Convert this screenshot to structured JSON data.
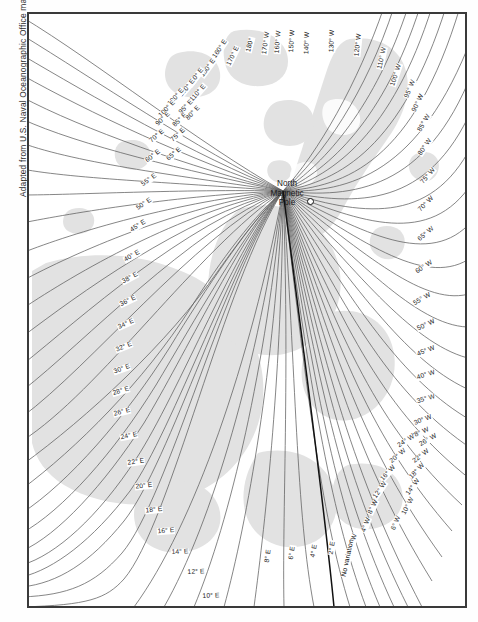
{
  "credit": "Adapted from U.S. Naval Oceanographic Office map",
  "pole": {
    "line1": "North",
    "line2": "Magnetic",
    "line3": "Pole",
    "marker": "pole-marker-circle"
  },
  "colors": {
    "background": "#ffffff",
    "frame": "#3a3a3a",
    "contour": "#5d5d5d",
    "agonic": "#111111",
    "land": "#e2e2e2",
    "text": "#1c1c1c"
  },
  "chart_data": {
    "type": "line",
    "xlabel": "",
    "ylabel": "",
    "legend": "none",
    "grid": false,
    "annotations": [
      "North Magnetic Pole",
      "No variation"
    ],
    "units": "degrees of magnetic variation (declination)",
    "east_values": [
      10,
      12,
      14,
      16,
      18,
      20,
      22,
      24,
      26,
      28,
      30,
      32,
      34,
      36,
      38,
      40,
      45,
      50,
      55,
      60,
      65,
      70,
      75,
      80,
      85,
      90,
      95,
      100,
      110,
      120,
      130,
      140,
      150,
      160,
      170,
      180
    ],
    "west_values": [
      2,
      4,
      6,
      8,
      10,
      12,
      14,
      16,
      18,
      20,
      22,
      24,
      26,
      28,
      30,
      35,
      40,
      45,
      50,
      55,
      60,
      65,
      70,
      75,
      80,
      85,
      90,
      95,
      100,
      110,
      120,
      130,
      140,
      150,
      160,
      170
    ],
    "agonic_label": "No variation",
    "small_east_values": [
      2,
      4,
      6,
      8
    ]
  },
  "labels": [
    {
      "t": "160° E",
      "x": 192,
      "y": 36,
      "r": -56
    },
    {
      "t": "150° E",
      "x": 180,
      "y": 55,
      "r": -54
    },
    {
      "t": "140° E",
      "x": 168,
      "y": 64,
      "r": -52
    },
    {
      "t": "130° E",
      "x": 159,
      "y": 75,
      "r": -50
    },
    {
      "t": "120° E",
      "x": 148,
      "y": 84,
      "r": -48
    },
    {
      "t": "110° E",
      "x": 170,
      "y": 80,
      "r": -49
    },
    {
      "t": "100° E",
      "x": 139,
      "y": 96,
      "r": -46
    },
    {
      "t": "95° E",
      "x": 158,
      "y": 94,
      "r": -46
    },
    {
      "t": "90° E",
      "x": 135,
      "y": 106,
      "r": -44
    },
    {
      "t": "85° E",
      "x": 152,
      "y": 107,
      "r": -44
    },
    {
      "t": "80° E",
      "x": 165,
      "y": 100,
      "r": -46
    },
    {
      "t": "75° E",
      "x": 150,
      "y": 122,
      "r": -42
    },
    {
      "t": "70° E",
      "x": 129,
      "y": 123,
      "r": -40
    },
    {
      "t": "65° E",
      "x": 146,
      "y": 141,
      "r": -40
    },
    {
      "t": "60° E",
      "x": 125,
      "y": 143,
      "r": -38
    },
    {
      "t": "55° E",
      "x": 121,
      "y": 167,
      "r": -36
    },
    {
      "t": "50° E",
      "x": 116,
      "y": 191,
      "r": -34
    },
    {
      "t": "45° E",
      "x": 110,
      "y": 213,
      "r": -32
    },
    {
      "t": "40° E",
      "x": 104,
      "y": 243,
      "r": -30
    },
    {
      "t": "38° E",
      "x": 102,
      "y": 265,
      "r": -28
    },
    {
      "t": "36° E",
      "x": 100,
      "y": 288,
      "r": -26
    },
    {
      "t": "34° E",
      "x": 98,
      "y": 311,
      "r": -24
    },
    {
      "t": "32° E",
      "x": 96,
      "y": 334,
      "r": -22
    },
    {
      "t": "30° E",
      "x": 94,
      "y": 356,
      "r": -20
    },
    {
      "t": "28° E",
      "x": 93,
      "y": 378,
      "r": -17
    },
    {
      "t": "26° E",
      "x": 94,
      "y": 399,
      "r": -14
    },
    {
      "t": "24° E",
      "x": 101,
      "y": 423,
      "r": -11
    },
    {
      "t": "22° E",
      "x": 108,
      "y": 449,
      "r": -8
    },
    {
      "t": "20° E",
      "x": 116,
      "y": 473,
      "r": -6
    },
    {
      "t": "18° E",
      "x": 126,
      "y": 497,
      "r": -5
    },
    {
      "t": "16° E",
      "x": 138,
      "y": 518,
      "r": -4
    },
    {
      "t": "14° E",
      "x": 152,
      "y": 539,
      "r": -3
    },
    {
      "t": "12° E",
      "x": 168,
      "y": 559,
      "r": -2
    },
    {
      "t": "10° E",
      "x": 183,
      "y": 583,
      "r": -2
    },
    {
      "t": "180°",
      "x": 222,
      "y": 32,
      "r": -76
    },
    {
      "t": "170° E",
      "x": 205,
      "y": 43,
      "r": -64
    },
    {
      "t": "170° W",
      "x": 238,
      "y": 30,
      "r": -82
    },
    {
      "t": "160° W",
      "x": 250,
      "y": 29,
      "r": -85
    },
    {
      "t": "150° W",
      "x": 264,
      "y": 28,
      "r": -87
    },
    {
      "t": "140° W",
      "x": 279,
      "y": 30,
      "r": -88
    },
    {
      "t": "130° W",
      "x": 304,
      "y": 28,
      "r": -88
    },
    {
      "t": "120° W",
      "x": 330,
      "y": 32,
      "r": -84
    },
    {
      "t": "110° W",
      "x": 354,
      "y": 45,
      "r": -78
    },
    {
      "t": "100° W",
      "x": 368,
      "y": 62,
      "r": -72
    },
    {
      "t": "95° W",
      "x": 382,
      "y": 76,
      "r": -68
    },
    {
      "t": "90° W",
      "x": 390,
      "y": 90,
      "r": -64
    },
    {
      "t": "85° W",
      "x": 396,
      "y": 110,
      "r": -60
    },
    {
      "t": "80° W",
      "x": 397,
      "y": 134,
      "r": -55
    },
    {
      "t": "75° W",
      "x": 400,
      "y": 163,
      "r": -50
    },
    {
      "t": "70° W",
      "x": 398,
      "y": 191,
      "r": -45
    },
    {
      "t": "65° W",
      "x": 398,
      "y": 221,
      "r": -40
    },
    {
      "t": "60° W",
      "x": 396,
      "y": 254,
      "r": -34
    },
    {
      "t": "55° W",
      "x": 394,
      "y": 286,
      "r": -30
    },
    {
      "t": "50° W",
      "x": 398,
      "y": 312,
      "r": -26
    },
    {
      "t": "45° W",
      "x": 398,
      "y": 338,
      "r": -22
    },
    {
      "t": "40° W",
      "x": 398,
      "y": 362,
      "r": -18
    },
    {
      "t": "35° W",
      "x": 398,
      "y": 386,
      "r": -16
    },
    {
      "t": "30° W",
      "x": 395,
      "y": 407,
      "r": -22
    },
    {
      "t": "28° W",
      "x": 392,
      "y": 420,
      "r": -24
    },
    {
      "t": "26° W",
      "x": 400,
      "y": 427,
      "r": -30
    },
    {
      "t": "24° W",
      "x": 378,
      "y": 428,
      "r": -32
    },
    {
      "t": "22° W",
      "x": 393,
      "y": 443,
      "r": -38
    },
    {
      "t": "20° W",
      "x": 370,
      "y": 443,
      "r": -40
    },
    {
      "t": "18° W",
      "x": 389,
      "y": 458,
      "r": -46
    },
    {
      "t": "16° W",
      "x": 360,
      "y": 460,
      "r": -48
    },
    {
      "t": "14° W",
      "x": 385,
      "y": 474,
      "r": -54
    },
    {
      "t": "12° W",
      "x": 352,
      "y": 477,
      "r": -56
    },
    {
      "t": "10° W",
      "x": 380,
      "y": 493,
      "r": -62
    },
    {
      "t": "8° W",
      "x": 345,
      "y": 494,
      "r": -64
    },
    {
      "t": "6° W",
      "x": 368,
      "y": 510,
      "r": -68
    },
    {
      "t": "4° W",
      "x": 338,
      "y": 512,
      "r": -70
    },
    {
      "t": "2° W",
      "x": 325,
      "y": 528,
      "r": -74
    },
    {
      "t": "No variation",
      "x": 320,
      "y": 545,
      "r": -78,
      "bold": true
    },
    {
      "t": "2° E",
      "x": 304,
      "y": 535,
      "r": -80
    },
    {
      "t": "4° E",
      "x": 286,
      "y": 538,
      "r": -80
    },
    {
      "t": "6° E",
      "x": 264,
      "y": 540,
      "r": -82
    },
    {
      "t": "8° E",
      "x": 240,
      "y": 543,
      "r": -83
    }
  ]
}
